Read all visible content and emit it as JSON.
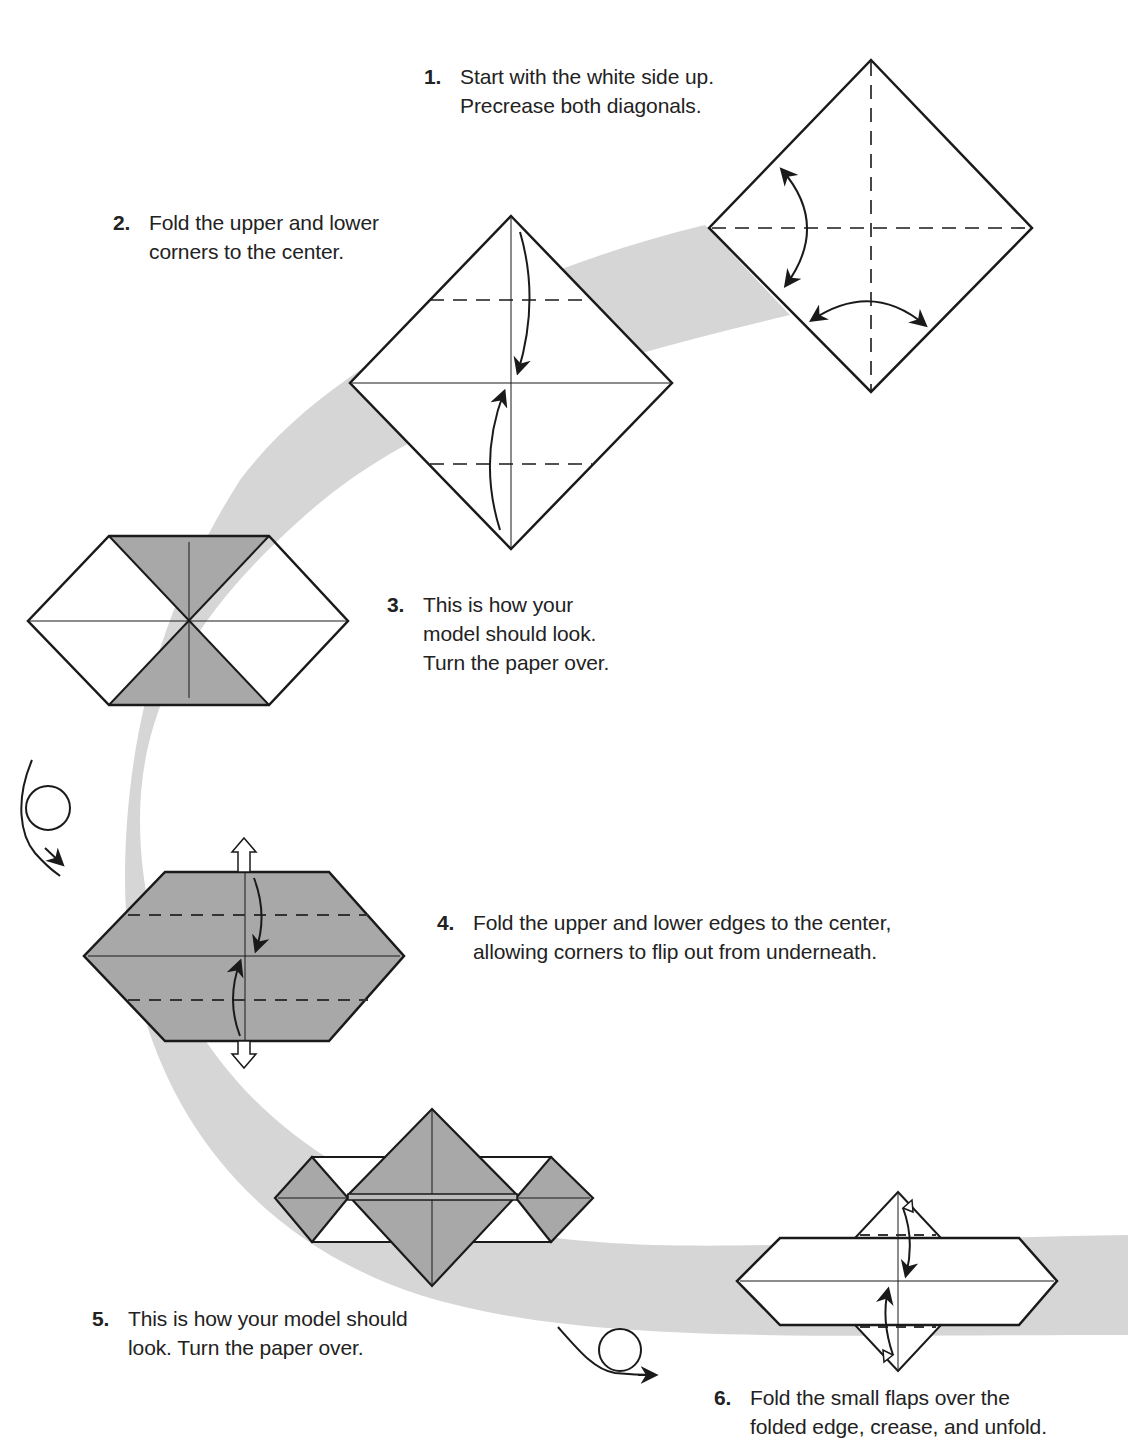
{
  "page": {
    "type": "origami instruction diagram",
    "colors": {
      "background": "#ffffff",
      "path_band": "#d6d6d6",
      "paper_colored": "#a8a8a8",
      "paper_white": "#ffffff",
      "line": "#1a1a1a"
    }
  },
  "steps": [
    {
      "number": "1.",
      "lines": [
        "Start with the white side up.",
        "Precrease both diagonals."
      ]
    },
    {
      "number": "2.",
      "lines": [
        "Fold the upper and lower",
        "corners to the center."
      ]
    },
    {
      "number": "3.",
      "lines": [
        "This is how your",
        "model should look.",
        "Turn the paper over."
      ]
    },
    {
      "number": "4.",
      "lines": [
        "Fold the upper and lower edges to the center,",
        "allowing corners to flip out from underneath."
      ]
    },
    {
      "number": "5.",
      "lines": [
        "This is how your model should",
        "look. Turn the paper over."
      ]
    },
    {
      "number": "6.",
      "lines": [
        "Fold the small flaps over the",
        "folded edge, crease, and unfold."
      ]
    }
  ],
  "icons": {
    "turn_over_1": "turn-over-arrow",
    "turn_over_2": "turn-over-arrow"
  }
}
